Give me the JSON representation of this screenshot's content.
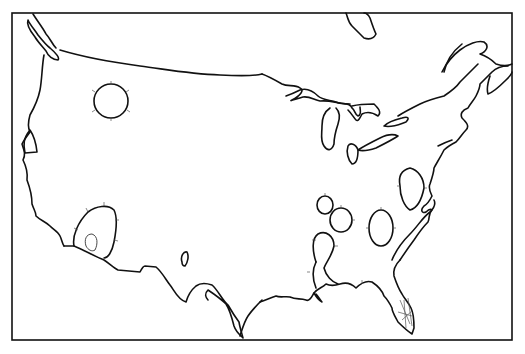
{
  "map": {
    "title": "",
    "subject": "Contiguous United States outline map with hachured closed contours",
    "frame_color": "#111111",
    "background": "#ffffff",
    "features": [
      {
        "name": "pacific-northwest-coast",
        "type": "coastline"
      },
      {
        "name": "canada-border",
        "type": "border"
      },
      {
        "name": "great-lakes",
        "type": "coastline"
      },
      {
        "name": "atlantic-coast",
        "type": "coastline"
      },
      {
        "name": "gulf-coast",
        "type": "coastline"
      },
      {
        "name": "mexico-border",
        "type": "border"
      },
      {
        "name": "florida-peninsula",
        "type": "coastline"
      }
    ],
    "contours": [
      {
        "name": "idaho-montana-circle",
        "cx": 111,
        "cy": 101
      },
      {
        "name": "southern-california-oval",
        "cx": 96,
        "cy": 233
      },
      {
        "name": "southern-california-inner-oval",
        "cx": 90,
        "cy": 243
      },
      {
        "name": "new-mexico-small-oval",
        "cx": 185,
        "cy": 259
      },
      {
        "name": "kentucky-small-oval",
        "cx": 325,
        "cy": 204
      },
      {
        "name": "tennessee-circle",
        "cx": 341,
        "cy": 217
      },
      {
        "name": "mississippi-oval",
        "cx": 325,
        "cy": 248
      },
      {
        "name": "georgia-oval",
        "cx": 381,
        "cy": 228
      },
      {
        "name": "virginia-oval",
        "cx": 410,
        "cy": 186
      }
    ]
  }
}
